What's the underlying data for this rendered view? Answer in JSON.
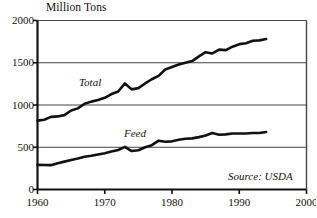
{
  "chart_data": {
    "type": "line",
    "title": "",
    "ylabel": "Million Tons",
    "xlabel": "",
    "xlim": [
      1960,
      2000
    ],
    "ylim": [
      0,
      2000
    ],
    "grid": true,
    "grid_axis": "y",
    "legend_position": "inline-annotation",
    "x_ticks": [
      "1960",
      "1970",
      "1980",
      "1990",
      "2000"
    ],
    "x_tick_values": [
      1960,
      1970,
      1980,
      1990,
      2000
    ],
    "y_ticks": [
      "0",
      "500",
      "1000",
      "1500",
      "2000"
    ],
    "y_tick_values": [
      0,
      500,
      1000,
      1500,
      2000
    ],
    "annotations": [
      {
        "text": "Source: USDA",
        "position": "bottom-right"
      },
      {
        "text": "Total",
        "position": "inline-upper-series"
      },
      {
        "text": "Feed",
        "position": "inline-lower-series"
      }
    ],
    "x": [
      1960,
      1961,
      1962,
      1963,
      1964,
      1965,
      1966,
      1967,
      1968,
      1969,
      1970,
      1971,
      1972,
      1973,
      1974,
      1975,
      1976,
      1977,
      1978,
      1979,
      1980,
      1981,
      1982,
      1983,
      1984,
      1985,
      1986,
      1987,
      1988,
      1989,
      1990,
      1991,
      1992,
      1993,
      1994
    ],
    "series": [
      {
        "name": "Total",
        "label": "Total",
        "color": "#111111",
        "values": [
          815,
          825,
          860,
          865,
          880,
          935,
          960,
          1015,
          1040,
          1060,
          1085,
          1130,
          1160,
          1255,
          1185,
          1200,
          1255,
          1305,
          1345,
          1420,
          1450,
          1480,
          1500,
          1520,
          1575,
          1625,
          1610,
          1655,
          1650,
          1690,
          1720,
          1730,
          1760,
          1765,
          1780
        ]
      },
      {
        "name": "Feed",
        "label": "Feed",
        "color": "#111111",
        "values": [
          292,
          290,
          288,
          310,
          330,
          350,
          368,
          388,
          400,
          415,
          430,
          450,
          468,
          505,
          455,
          465,
          500,
          525,
          578,
          565,
          570,
          588,
          600,
          605,
          620,
          638,
          668,
          648,
          652,
          662,
          662,
          662,
          668,
          668,
          680
        ]
      }
    ]
  },
  "axis_title": {
    "y": "Million Tons"
  },
  "source": {
    "text": "Source: USDA"
  }
}
